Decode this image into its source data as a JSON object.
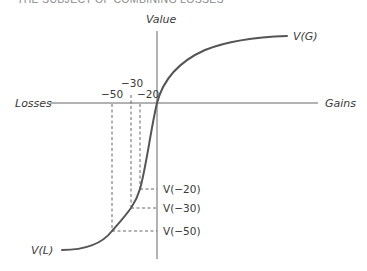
{
  "header": {
    "title": "The Subject of Combining Losses"
  },
  "axes": {
    "y_label": "Value",
    "x_left_label": "Losses",
    "x_right_label": "Gains"
  },
  "curve": {
    "gain_end_label": "V(G)",
    "loss_end_label": "V(L)"
  },
  "x_ticks": [
    {
      "label": "−50",
      "value": -50
    },
    {
      "label": "−30",
      "value": -30
    },
    {
      "label": "−20",
      "value": -20
    }
  ],
  "y_marks": [
    {
      "label": "V(−20)",
      "value_of": -20
    },
    {
      "label": "V(−30)",
      "value_of": -30
    },
    {
      "label": "V(−50)",
      "value_of": -50
    }
  ],
  "colors": {
    "curve": "#555555",
    "axis": "#666666",
    "text": "#3a3a3a"
  }
}
